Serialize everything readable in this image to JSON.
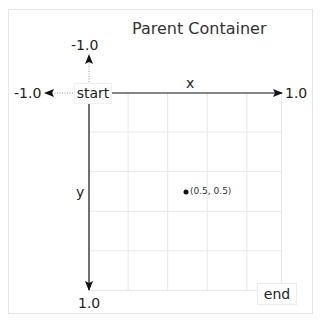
{
  "title": "Parent Container",
  "origin_label": "start",
  "end_label": "end",
  "axes": {
    "x": {
      "label": "x",
      "min_label": "-1.0",
      "max_label": "1.0"
    },
    "y": {
      "label": "y",
      "min_label": "-1.0",
      "max_label": "1.0"
    }
  },
  "point": {
    "x": 0.5,
    "y": 0.5,
    "label": "(0.5, 0.5)"
  },
  "grid": {
    "columns": 5,
    "rows": 5
  },
  "colors": {
    "axis": "#111111",
    "grid": "#e8e8e8",
    "dotted": "#999999"
  }
}
